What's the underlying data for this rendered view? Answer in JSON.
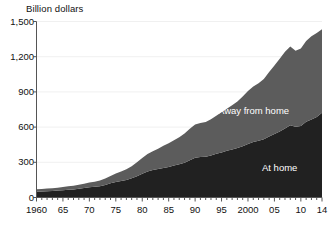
{
  "chart_data": {
    "type": "area",
    "stacked": true,
    "title": "Billion dollars",
    "subtitle": "",
    "xlabel": "",
    "ylabel": "Billion dollars",
    "ylim": [
      0,
      1500
    ],
    "xlim": [
      1960,
      2014
    ],
    "y_ticks": [
      0,
      300,
      600,
      900,
      1200,
      1500
    ],
    "y_tick_labels": [
      "0",
      "300",
      "600",
      "900",
      "1,200",
      "1,500"
    ],
    "x_ticks": [
      1960,
      1965,
      1970,
      1975,
      1980,
      1985,
      1990,
      1995,
      2000,
      2005,
      2010,
      2014
    ],
    "x_tick_labels": [
      "1960",
      "65",
      "70",
      "75",
      "80",
      "85",
      "90",
      "95",
      "2000",
      "05",
      "10",
      "14"
    ],
    "x_minor_tick_interval": 1,
    "grid": "horizontal-faint",
    "legend_position": "inline-annotation",
    "colors": {
      "at_home": "#212121",
      "away_from_home": "#5c5c5c",
      "background": "#ffffff",
      "axis": "#555555",
      "text": "#111111",
      "label_text": "#ffffff"
    },
    "x": [
      1960,
      1961,
      1962,
      1963,
      1964,
      1965,
      1966,
      1967,
      1968,
      1969,
      1970,
      1971,
      1972,
      1973,
      1974,
      1975,
      1976,
      1977,
      1978,
      1979,
      1980,
      1981,
      1982,
      1983,
      1984,
      1985,
      1986,
      1987,
      1988,
      1989,
      1990,
      1991,
      1992,
      1993,
      1994,
      1995,
      1996,
      1997,
      1998,
      1999,
      2000,
      2001,
      2002,
      2003,
      2004,
      2005,
      2006,
      2007,
      2008,
      2009,
      2010,
      2011,
      2012,
      2013,
      2014
    ],
    "series": [
      {
        "name": "At home",
        "color": "#212121",
        "values": [
          50,
          52,
          54,
          56,
          59,
          62,
          66,
          69,
          74,
          80,
          87,
          91,
          96,
          107,
          121,
          133,
          141,
          150,
          163,
          182,
          203,
          222,
          234,
          243,
          252,
          261,
          272,
          283,
          297,
          317,
          338,
          345,
          348,
          358,
          372,
          384,
          399,
          410,
          422,
          437,
          455,
          473,
          484,
          497,
          520,
          541,
          563,
          588,
          615,
          603,
          610,
          645,
          664,
          687,
          723
        ]
      },
      {
        "name": "Away from home",
        "color": "#5c5c5c",
        "values": [
          20,
          21,
          22,
          23,
          25,
          27,
          29,
          31,
          34,
          37,
          41,
          44,
          49,
          55,
          62,
          72,
          81,
          90,
          103,
          118,
          133,
          149,
          160,
          172,
          188,
          201,
          216,
          231,
          249,
          268,
          285,
          290,
          295,
          308,
          325,
          342,
          358,
          377,
          397,
          424,
          452,
          472,
          489,
          512,
          549,
          585,
          620,
          655,
          672,
          648,
          660,
          688,
          711,
          716,
          712
        ]
      }
    ],
    "annotations": [
      {
        "text": "Away from home",
        "x": 2000,
        "y": 980
      },
      {
        "text": "At home",
        "x": 2009,
        "y": 360
      }
    ]
  },
  "axis_title_text": "Billion dollars"
}
